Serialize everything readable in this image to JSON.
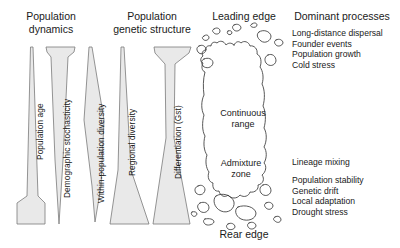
{
  "figure": {
    "background_color": "#ffffff",
    "wedge_fill_color": "#e9e9e9",
    "wedge_stroke_color": "#6b6b6b",
    "map_stroke_color": "#3a3a3a",
    "text_color": "#1a1a1a"
  },
  "headers": {
    "population_dynamics": "Population\ndynamics",
    "population_genetic_structure": "Population\ngenetic structure",
    "leading_edge": "Leading edge",
    "dominant_processes": "Dominant processes"
  },
  "edges": {
    "leading": "Leading edge",
    "rear": "Rear edge"
  },
  "range_map": {
    "continuous_range_label": "Continuous\nrange",
    "admixture_zone_label": "Admixture\nzone"
  },
  "wedges": [
    {
      "id": "population-age",
      "label": "Population age",
      "group": "population_dynamics",
      "shape": "narrow-top-wide-bottom",
      "meaning": "increases from leading edge to rear edge"
    },
    {
      "id": "demographic-stochasticity",
      "label": "Demographic stochasticity",
      "group": "population_dynamics",
      "shape": "wide-top-point-bottom",
      "meaning": "decreases from leading edge to rear edge"
    },
    {
      "id": "within-population-diversity",
      "label": "Within-population diversity",
      "group": "population_genetic_structure",
      "shape": "lens-widest-middle",
      "meaning": "peaks in the continuous range"
    },
    {
      "id": "regional-diversity",
      "label": "Regional diversity",
      "group": "population_genetic_structure",
      "shape": "narrow-top-wide-bottom",
      "meaning": "increases toward the rear edge"
    },
    {
      "id": "differentiation-gst",
      "label": "Differentiation (Gst)",
      "group": "population_genetic_structure",
      "shape": "hourglass",
      "meaning": "high at both edges, low in the continuous range"
    }
  ],
  "dominant_processes": {
    "leading_edge": [
      "Long-distance dispersal",
      "Founder events",
      "Population growth",
      "Cold stress"
    ],
    "admixture_zone": [
      "Lineage mixing"
    ],
    "rear_edge": [
      "Population stability",
      "Genetic drift",
      "Local adaptation",
      "Drought stress"
    ]
  }
}
